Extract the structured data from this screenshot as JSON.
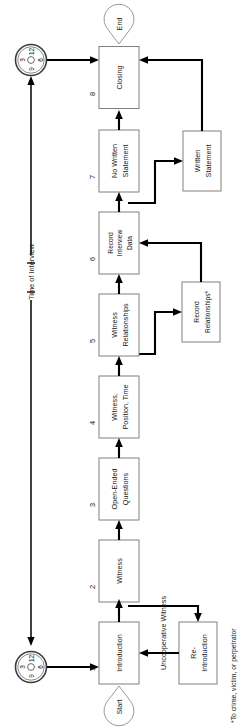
{
  "diagram": {
    "orientation": "rotated-90-ccw",
    "footnote": "*To crime, victim, or perpetrator",
    "timeline_label": "Time of Interview",
    "branch_label": "Uncooperative Witness",
    "terminators": {
      "start": "Start",
      "end": "End"
    },
    "clock_face": {
      "icon": "clock-icon",
      "numerals": [
        "12",
        "3",
        "6",
        "9"
      ]
    },
    "steps": [
      {
        "number": "1",
        "line1": "Introduction",
        "line2": ""
      },
      {
        "number": "2",
        "line1": "Witness",
        "line2": ""
      },
      {
        "number": "3",
        "line1": "Open-Ended",
        "line2": "Questions"
      },
      {
        "number": "4",
        "line1": "Witness,",
        "line2": "Position, Time"
      },
      {
        "number": "5",
        "line1": "Witness",
        "line2": "Relationships"
      },
      {
        "number": "6",
        "line1": "Record",
        "line2": "Interview",
        "line3": "Data"
      },
      {
        "number": "7",
        "line1": "No Written",
        "line2": "Statement"
      },
      {
        "number": "8",
        "line1": "Closing",
        "line2": ""
      }
    ],
    "side_nodes": [
      {
        "id": "re-introduction",
        "line1": "Re-",
        "line2": "Introduction"
      },
      {
        "id": "record-relationships",
        "line1": "Record",
        "line2": "Relationships*"
      },
      {
        "id": "written-statement",
        "line1": "Written",
        "line2": "Statement"
      }
    ]
  }
}
